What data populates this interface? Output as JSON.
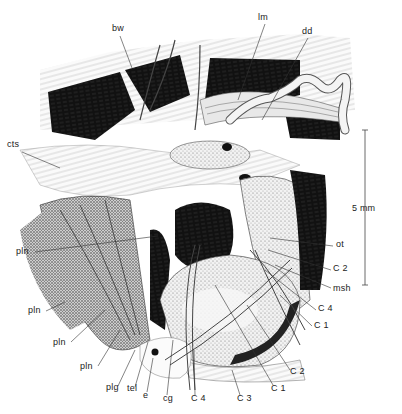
{
  "figure": {
    "scale_bar": {
      "label": "5 mm"
    },
    "labels": [
      {
        "id": "bw",
        "text": "bw",
        "x": 115,
        "y": 27
      },
      {
        "id": "lm",
        "text": "lm",
        "x": 260,
        "y": 15
      },
      {
        "id": "dd",
        "text": "dd",
        "x": 303,
        "y": 29
      },
      {
        "id": "cts",
        "text": "cts",
        "x": 9,
        "y": 144
      },
      {
        "id": "pln1",
        "text": "pln",
        "x": 17,
        "y": 249
      },
      {
        "id": "ot",
        "text": "ot",
        "x": 336,
        "y": 243
      },
      {
        "id": "C2a",
        "text": "C 2",
        "x": 333,
        "y": 268
      },
      {
        "id": "msh",
        "text": "msh",
        "x": 333,
        "y": 287
      },
      {
        "id": "C4a",
        "text": "C 4",
        "x": 318,
        "y": 308
      },
      {
        "id": "C1a",
        "text": "C 1",
        "x": 314,
        "y": 324
      },
      {
        "id": "pln2",
        "text": "pln",
        "x": 28,
        "y": 309
      },
      {
        "id": "pln3",
        "text": "pln",
        "x": 53,
        "y": 340
      },
      {
        "id": "pln4",
        "text": "pln",
        "x": 80,
        "y": 364
      },
      {
        "id": "C2b",
        "text": "C 2",
        "x": 290,
        "y": 370
      },
      {
        "id": "plg",
        "text": "plg",
        "x": 106,
        "y": 385
      },
      {
        "id": "tel",
        "text": "tel",
        "x": 127,
        "y": 386
      },
      {
        "id": "e",
        "text": "e",
        "x": 143,
        "y": 393
      },
      {
        "id": "cg",
        "text": "cg",
        "x": 163,
        "y": 396
      },
      {
        "id": "C4b",
        "text": "C 4",
        "x": 191,
        "y": 396
      },
      {
        "id": "C3",
        "text": "C 3",
        "x": 237,
        "y": 396
      },
      {
        "id": "C1b",
        "text": "C 1",
        "x": 271,
        "y": 386
      }
    ]
  }
}
